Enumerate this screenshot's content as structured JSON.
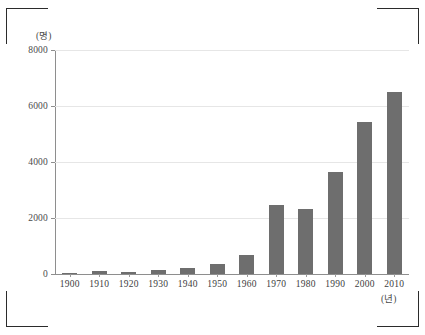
{
  "chart_data": {
    "type": "bar",
    "title": "",
    "subtitle": "",
    "xlabel": "(년)",
    "ylabel": "(명)",
    "categories": [
      "1900",
      "1910",
      "1920",
      "1930",
      "1940",
      "1950",
      "1960",
      "1970",
      "1980",
      "1990",
      "2000",
      "2010"
    ],
    "values": [
      40,
      90,
      70,
      150,
      230,
      350,
      680,
      2460,
      2320,
      3650,
      5430,
      6500
    ],
    "series": [
      {
        "name": "인구",
        "values": [
          40,
          90,
          70,
          150,
          230,
          350,
          680,
          2460,
          2320,
          3650,
          5430,
          6500
        ]
      }
    ],
    "ylim": [
      0,
      8000
    ],
    "yticks": [
      0,
      2000,
      4000,
      6000,
      8000
    ],
    "ytick_labels": [
      "0",
      "2000",
      "4000",
      "6000",
      "8000"
    ],
    "grid": true,
    "legend": "none",
    "bar_color": "#6e6e6e",
    "gridline_color": "#e6e6e6",
    "axis_color": "#8e8e8e"
  },
  "axes": {
    "y_unit_label": "(명)",
    "x_unit_label": "(년)"
  },
  "marks": {
    "crop_top_left": "crop-mark",
    "crop_top_right": "crop-mark",
    "crop_bottom_left": "crop-mark",
    "crop_bottom_right": "crop-mark"
  }
}
